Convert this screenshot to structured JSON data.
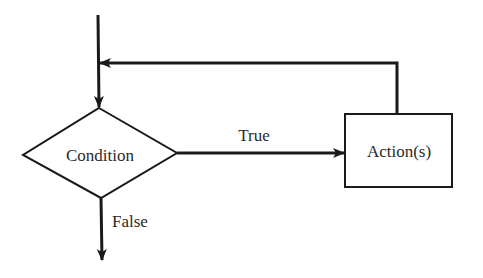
{
  "diagram": {
    "type": "flowchart",
    "title": "",
    "nodes": [
      {
        "id": "condition",
        "shape": "diamond",
        "label": "Condition"
      },
      {
        "id": "actions",
        "shape": "rectangle",
        "label": "Action(s)"
      }
    ],
    "edges": [
      {
        "from": "entry",
        "to": "condition",
        "label": ""
      },
      {
        "from": "condition",
        "to": "actions",
        "label": "True"
      },
      {
        "from": "condition",
        "to": "exit",
        "label": "False"
      },
      {
        "from": "actions",
        "to": "condition",
        "label": "",
        "kind": "loop-back"
      }
    ],
    "colors": {
      "stroke": "#1a1a1a",
      "text": "#2a2a2a",
      "background": "#ffffff"
    }
  }
}
